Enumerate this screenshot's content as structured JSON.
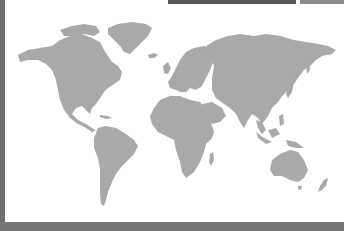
{
  "map": {
    "type": "world-map",
    "land_color": "#a9a9a9",
    "ocean_color": "#ffffff",
    "regions": [
      "north-america",
      "greenland",
      "south-america",
      "europe",
      "africa",
      "asia",
      "australia",
      "new-zealand",
      "madagascar",
      "japan",
      "indonesia",
      "caribbean",
      "iceland",
      "british-isles"
    ]
  },
  "frame": {
    "left_border_color": "#6e6e6e",
    "bottom_band_color": "#777777",
    "top_bar_colors": [
      "#5a5a5a",
      "#8a8a8a"
    ]
  }
}
